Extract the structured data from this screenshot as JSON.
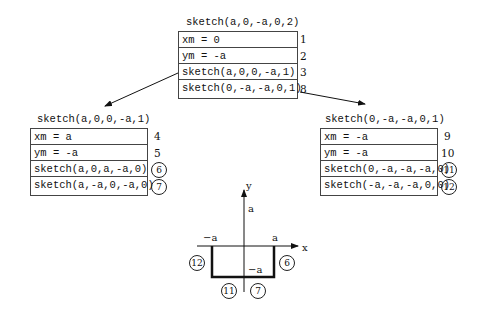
{
  "top": {
    "title": "sketch(a,0,-a,0,2)",
    "rows": [
      "xm = 0",
      "ym = -a",
      "sketch(a,0,0,-a,1)",
      "sketch(0,-a,-a,0,1)"
    ],
    "nums": [
      "1",
      "2",
      "3",
      "8"
    ]
  },
  "left": {
    "title": "sketch(a,0,0,-a,1)",
    "rows": [
      "xm = a",
      "ym = -a",
      "sketch(a,0,a,-a,0)",
      "sketch(a,-a,0,-a,0)"
    ],
    "nums": [
      "4",
      "5",
      "6",
      "7"
    ]
  },
  "right": {
    "title": "sketch(0,-a,-a,0,1)",
    "rows": [
      "xm = -a",
      "ym = -a",
      "sketch(0,-a,-a,-a,0)",
      "sketch(-a,-a,-a,0,0)"
    ],
    "nums": [
      "9",
      "10",
      "11",
      "12"
    ]
  },
  "graph": {
    "x_label": "x",
    "y_label": "y",
    "y_tick": "a",
    "x_tick_neg": "−a",
    "x_tick_pos": "a",
    "bottom_label": "−a",
    "circles": {
      "left": "12",
      "right": "6",
      "bottom_left": "11",
      "bottom_right": "7"
    }
  }
}
